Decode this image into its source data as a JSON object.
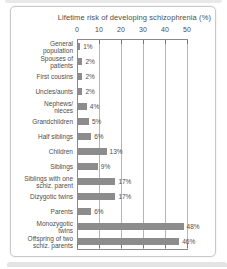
{
  "chart_data": {
    "type": "bar",
    "orientation": "horizontal",
    "title": "Lifetime risk of developing schizophrenia (%)",
    "categories": [
      "General\npopulation",
      "Spouses of\npatients",
      "First cousins",
      "Uncles/aunts",
      "Nephews/\nnieces",
      "Grandchildren",
      "Half siblings",
      "Children",
      "Siblings",
      "Siblings with one\nschiz. parent",
      "Dizygotic twins",
      "Parents",
      "Monozygotic\ntwins",
      "Offspring of two\nschiz. parents"
    ],
    "values": [
      1,
      2,
      2,
      2,
      4,
      5,
      6,
      13,
      9,
      17,
      17,
      6,
      48,
      46
    ],
    "value_labels": [
      "1%",
      "2%",
      "2%",
      "2%",
      "4%",
      "5%",
      "6%",
      "13%",
      "9%",
      "17%",
      "17%",
      "6%",
      "48%",
      "46%"
    ],
    "x_ticks": [
      0,
      10,
      20,
      30,
      40,
      50
    ],
    "xlim": [
      0,
      50
    ],
    "grid": true,
    "legend": "none",
    "colors": {
      "bar": "#8c8c8c",
      "axis": "#8a8a8a",
      "grid": "#b5b5b5",
      "tick": "#7a7a7a",
      "text": "#4d4d4d",
      "card_border": "#c9c9c9"
    }
  }
}
